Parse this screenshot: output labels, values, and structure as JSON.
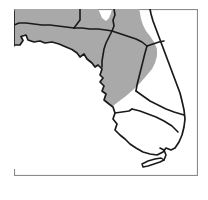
{
  "figure": {
    "background_color": "#ffffff"
  },
  "frame": {
    "name": "map-border-frame",
    "stroke_color": "#8c8c8c",
    "fill_color": "#ffffff",
    "x": 14,
    "y": 9,
    "width": 184,
    "height": 167
  },
  "map": {
    "state_name": "Florida",
    "outline_color": "#1a1a1a",
    "shaded_fill": "#a9a9a9",
    "unshaded_fill": "#ffffff",
    "regions": [
      {
        "id": "panhandle-north",
        "label": "Panhandle (shaded)",
        "shaded": true
      },
      {
        "id": "north-central",
        "label": "North central peninsula (shaded)",
        "shaded": true
      },
      {
        "id": "northeast-coast",
        "label": "Northeast coastal counties (shaded)",
        "shaded": true
      },
      {
        "id": "east-central",
        "label": "East central counties (shaded)",
        "shaded": true
      },
      {
        "id": "southwest",
        "label": "Southwest peninsula (unshaded)",
        "shaded": false
      },
      {
        "id": "south",
        "label": "South Florida (unshaded)",
        "shaded": false
      },
      {
        "id": "keys",
        "label": "Florida Keys (unshaded)",
        "shaded": false
      }
    ]
  },
  "legend": {
    "visible": false,
    "items": []
  }
}
